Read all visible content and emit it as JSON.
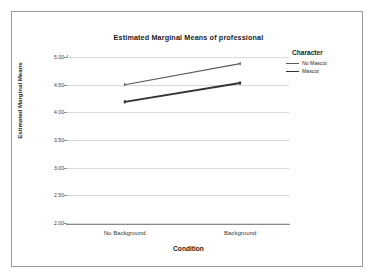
{
  "figure": {
    "title": "Estimated Marginal Means of professional",
    "background_color": "#ffffff",
    "frame_color": "#9b9b9b",
    "gridline_color": "#d9d9d9",
    "axis_color": "#8a8a8a"
  },
  "legend": {
    "title": "Character",
    "position": "right",
    "entries": [
      {
        "label": "No Mascot",
        "color": "#595959",
        "line_width": 1.1
      },
      {
        "label": "Mascot",
        "color": "#333333",
        "line_width": 1.9
      }
    ]
  },
  "axes": {
    "x_title": "Condition",
    "y_title": "Estimated Marginal Means",
    "x_tick_labels": [
      "No Background",
      "Background"
    ],
    "y_tick_labels": [
      "5.00",
      "4.50",
      "4.00",
      "3.50",
      "3.00",
      "2.50",
      "2.00"
    ]
  },
  "chart_data": {
    "type": "line",
    "title": "Estimated Marginal Means of professional",
    "xlabel": "Condition",
    "ylabel": "Estimated Marginal Means",
    "categories": [
      "No Background",
      "Background"
    ],
    "ylim": [
      2.0,
      5.0
    ],
    "ytick_values": [
      5.0,
      4.5,
      4.0,
      3.5,
      3.0,
      2.5,
      2.0
    ],
    "grid": true,
    "legend_title": "Character",
    "legend_position": "right",
    "series": [
      {
        "name": "No Mascot",
        "values": [
          4.5,
          4.88
        ],
        "color": "#595959",
        "line_width": 1.1
      },
      {
        "name": "Mascot",
        "values": [
          4.19,
          4.53
        ],
        "color": "#333333",
        "line_width": 1.9
      }
    ]
  }
}
